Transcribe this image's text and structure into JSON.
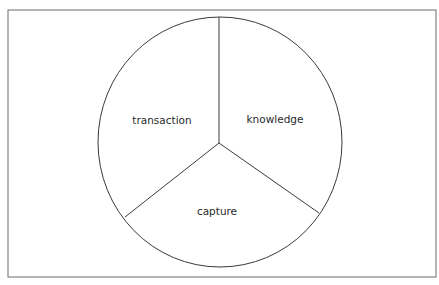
{
  "diagram": {
    "type": "three-sector-circle",
    "sectors": [
      {
        "label": "transaction",
        "position": "upper-left"
      },
      {
        "label": "knowledge",
        "position": "upper-right"
      },
      {
        "label": "capture",
        "position": "bottom"
      }
    ],
    "colors": {
      "line": "#3a3a3a",
      "frame": "#6a6a6a",
      "background": "#ffffff"
    }
  }
}
